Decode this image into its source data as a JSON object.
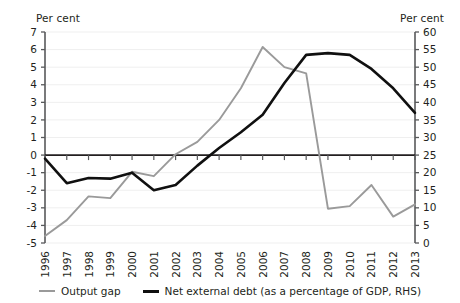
{
  "axis_unit_left": "Per cent",
  "axis_unit_right": "Per cent",
  "legend": {
    "items": [
      {
        "label": "Output gap",
        "color": "#9a9a9a"
      },
      {
        "label": "Net external debt (as a percentage of GDP, RHS)",
        "color": "#101010"
      }
    ]
  },
  "chart_data": {
    "type": "line",
    "title": "",
    "subtitle": "",
    "xlabel": "",
    "ylabel": "Per cent",
    "y2label": "Per cent",
    "grid": true,
    "legend_position": "bottom",
    "categories": [
      "1996",
      "1997",
      "1998",
      "1999",
      "2000",
      "2001",
      "2002",
      "2003",
      "2004",
      "2005",
      "2006",
      "2007",
      "2008",
      "2009",
      "2010",
      "2011",
      "2012",
      "2013"
    ],
    "ylim": [
      -5,
      7
    ],
    "yticks": [
      7,
      6,
      5,
      4,
      3,
      2,
      1,
      0,
      -1,
      -2,
      -3,
      -4,
      -5
    ],
    "ytick_labels": [
      "7",
      "6",
      "5",
      "4",
      "3",
      "2",
      "1",
      "0",
      "-1",
      "-2",
      "-3",
      "-4",
      "-5"
    ],
    "y2lim": [
      0,
      60
    ],
    "y2ticks": [
      60,
      55,
      50,
      45,
      40,
      35,
      30,
      25,
      20,
      15,
      10,
      5,
      0
    ],
    "y2tick_labels": [
      "60",
      "55",
      "50",
      "45",
      "40",
      "35",
      "30",
      "25",
      "20",
      "15",
      "10",
      "5",
      "0"
    ],
    "series": [
      {
        "name": "Output gap",
        "axis": "left",
        "color": "#9a9a9a",
        "values": [
          -4.6,
          -3.7,
          -2.35,
          -2.45,
          -0.95,
          -1.2,
          0.05,
          0.75,
          2.0,
          3.8,
          6.15,
          5.0,
          4.65,
          -3.05,
          -2.9,
          -1.7,
          -3.5,
          -2.8
        ]
      },
      {
        "name": "Net external debt (as a percentage of GDP, RHS)",
        "axis": "right",
        "color": "#101010",
        "values": [
          24.0,
          17.0,
          18.5,
          18.3,
          20.0,
          15.0,
          16.5,
          22.0,
          27.0,
          31.5,
          36.5,
          45.5,
          53.5,
          54.0,
          53.5,
          49.5,
          44.0,
          37.0
        ]
      }
    ]
  }
}
